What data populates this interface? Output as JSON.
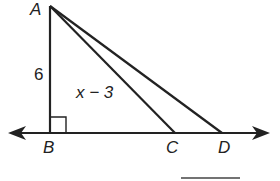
{
  "diagram": {
    "type": "geometry-triangle",
    "points": {
      "A": {
        "label": "A",
        "x": 50,
        "y": 6
      },
      "B": {
        "label": "B",
        "x": 50,
        "y": 133
      },
      "C": {
        "label": "C",
        "x": 175,
        "y": 133
      },
      "D": {
        "label": "D",
        "x": 222,
        "y": 133
      }
    },
    "segments": [
      {
        "from": "A",
        "to": "B"
      },
      {
        "from": "A",
        "to": "C"
      },
      {
        "from": "A",
        "to": "D"
      }
    ],
    "line": {
      "through": [
        "B",
        "C",
        "D"
      ],
      "arrows": "both"
    },
    "right_angle_at": "B",
    "labels": {
      "side_AB": "6",
      "expression": "x − 3",
      "A": "A",
      "B": "B",
      "C": "C",
      "D": "D"
    },
    "answer_blank": true,
    "stroke_color": "#222222"
  }
}
